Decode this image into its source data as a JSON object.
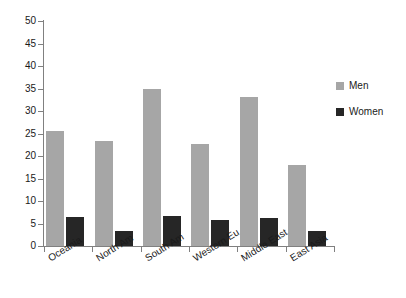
{
  "chart_data": {
    "type": "bar",
    "title": "",
    "subtitle": "",
    "xlabel": "",
    "ylabel": "",
    "ylim": [
      0,
      50
    ],
    "ytick_step": 5,
    "yticks": [
      "50",
      "45",
      "40",
      "35",
      "30",
      "25",
      "20",
      "15",
      "10",
      "5",
      "0"
    ],
    "ytick_values": [
      50,
      45,
      40,
      35,
      30,
      25,
      20,
      15,
      10,
      5,
      0
    ],
    "grid": false,
    "legend_position": "right",
    "categories": [
      "Oceania",
      "North Am",
      "South Am",
      "Western Eu",
      "Middle East",
      "East Asia"
    ],
    "series": [
      {
        "name": "Men",
        "color": "#a6a6a6",
        "values": [
          25.5,
          23.3,
          35.0,
          22.7,
          33.1,
          18.1
        ]
      },
      {
        "name": "Women",
        "color": "#262626",
        "values": [
          6.4,
          3.3,
          6.7,
          5.8,
          6.3,
          3.3
        ]
      }
    ]
  },
  "legend": {
    "items": [
      {
        "label": "Men",
        "color": "#a6a6a6"
      },
      {
        "label": "Women",
        "color": "#262626"
      }
    ]
  },
  "axis": {
    "y_max_label": "50",
    "y_min_label": "0"
  }
}
